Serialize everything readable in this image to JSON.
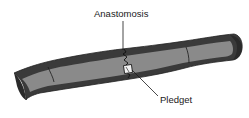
{
  "diagram": {
    "labels": {
      "anastomosis": "Anastomosis",
      "pledget": "Pledget"
    },
    "colors": {
      "outer_wall": "#3a3a3a",
      "inner_lumen": "#8a8a8a",
      "leader_line": "#1a1a1a",
      "pledget": "#f2f2f2",
      "background": "#ffffff"
    }
  }
}
